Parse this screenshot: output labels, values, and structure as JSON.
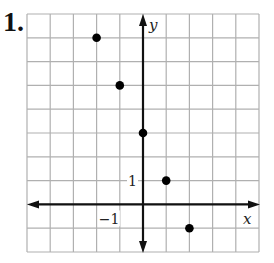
{
  "problem": {
    "number": "1."
  },
  "chart_data": {
    "type": "scatter",
    "title": "",
    "xlabel": "x",
    "ylabel": "y",
    "xlim": [
      -5,
      5
    ],
    "ylim": [
      -2,
      8
    ],
    "grid": true,
    "tick_labels": {
      "x": [
        {
          "value": -1,
          "label": "−1"
        }
      ],
      "y": [
        {
          "value": 1,
          "label": "1"
        }
      ]
    },
    "series": [
      {
        "name": "points",
        "x": [
          -2,
          -1,
          0,
          1,
          2
        ],
        "y": [
          7,
          5,
          3,
          1,
          -1
        ]
      }
    ],
    "colors": {
      "grid": "#b0b0b0",
      "axis": "#111111",
      "point": "#000000"
    }
  }
}
